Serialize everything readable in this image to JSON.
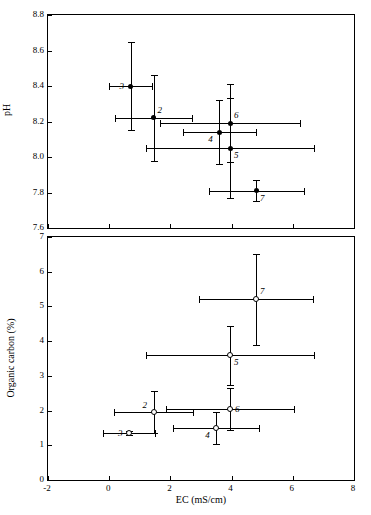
{
  "chart_data": [
    {
      "type": "scatter",
      "panel": "top",
      "title": "",
      "xlabel": "EC (mS/cm)",
      "ylabel": "pH",
      "xlim": [
        -2,
        8
      ],
      "ylim": [
        7.6,
        8.8
      ],
      "xticks": [
        -2,
        0,
        2,
        4,
        6,
        8
      ],
      "yticks": [
        7.6,
        7.8,
        8.0,
        8.2,
        8.4,
        8.6,
        8.8
      ],
      "ytick_labels": [
        "7.6",
        "7.8",
        "8.0",
        "8.2",
        "8.4",
        "8.6",
        "8.8"
      ],
      "xtick_labels": [
        "-2",
        "0",
        "2",
        "4",
        "6",
        "8"
      ],
      "grid": false,
      "marker": "filled-circle",
      "errorbars": "both",
      "points": [
        {
          "label": "3",
          "x": 0.7,
          "y": 8.4,
          "xerr": 0.7,
          "yerr": 0.25,
          "label_pos": "left"
        },
        {
          "label": "2",
          "x": 1.45,
          "y": 8.22,
          "xerr": 1.25,
          "yerr": 0.24,
          "label_pos": "above-right"
        },
        {
          "label": "4",
          "x": 3.6,
          "y": 8.14,
          "xerr": 1.2,
          "yerr": 0.18,
          "label_pos": "below-left"
        },
        {
          "label": "6",
          "x": 3.95,
          "y": 8.19,
          "xerr": 2.3,
          "yerr": 0.22,
          "label_pos": "above-right"
        },
        {
          "label": "5",
          "x": 3.95,
          "y": 8.05,
          "xerr": 2.75,
          "yerr": 0.28,
          "label_pos": "below-right"
        },
        {
          "label": "7",
          "x": 4.8,
          "y": 7.81,
          "xerr": 1.55,
          "yerr": 0.06,
          "label_pos": "below-right"
        }
      ]
    },
    {
      "type": "scatter",
      "panel": "bottom",
      "title": "",
      "xlabel": "EC (mS/cm)",
      "ylabel": "Organic carbon (%)",
      "xlim": [
        -2,
        8
      ],
      "ylim": [
        0,
        7
      ],
      "xticks": [
        -2,
        0,
        2,
        4,
        6,
        8
      ],
      "yticks": [
        0,
        1,
        2,
        3,
        4,
        5,
        6,
        7
      ],
      "ytick_labels": [
        "0",
        "1",
        "2",
        "3",
        "4",
        "5",
        "6",
        "7"
      ],
      "xtick_labels": [
        "-2",
        "0",
        "2",
        "4",
        "6",
        "8"
      ],
      "grid": false,
      "marker": "open-circle",
      "errorbars": "both",
      "points": [
        {
          "label": "3",
          "x": 0.65,
          "y": 1.35,
          "xerr": 0.85,
          "yerr": 0.05,
          "label_pos": "left"
        },
        {
          "label": "2",
          "x": 1.45,
          "y": 1.95,
          "xerr": 1.3,
          "yerr": 0.6,
          "label_pos": "above-left"
        },
        {
          "label": "4",
          "x": 3.5,
          "y": 1.5,
          "xerr": 1.4,
          "yerr": 0.45,
          "label_pos": "below-left"
        },
        {
          "label": "6",
          "x": 3.95,
          "y": 2.05,
          "xerr": 2.1,
          "yerr": 0.6,
          "label_pos": "right"
        },
        {
          "label": "5",
          "x": 3.95,
          "y": 3.6,
          "xerr": 2.75,
          "yerr": 0.85,
          "label_pos": "below-right"
        },
        {
          "label": "7",
          "x": 4.8,
          "y": 5.2,
          "xerr": 1.85,
          "yerr": 1.3,
          "label_pos": "above-right"
        }
      ]
    }
  ]
}
